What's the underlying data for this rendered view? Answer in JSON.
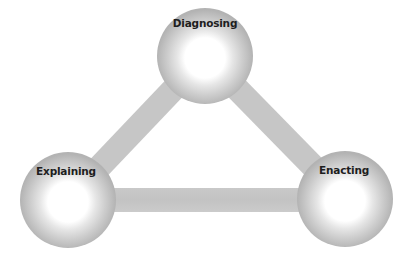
{
  "diagram": {
    "type": "cycle-triangle",
    "nodes": [
      {
        "id": "diagnosing",
        "label": "Diagnosing",
        "position": "top"
      },
      {
        "id": "explaining",
        "label": "Explaining",
        "position": "bottom-left"
      },
      {
        "id": "enacting",
        "label": "Enacting",
        "position": "bottom-right"
      }
    ],
    "edges": [
      {
        "from": "diagnosing",
        "to": "explaining"
      },
      {
        "from": "diagnosing",
        "to": "enacting"
      },
      {
        "from": "explaining",
        "to": "enacting"
      }
    ],
    "colors": {
      "connector": "#c6c6c6",
      "node_rim": "#b5b5b5",
      "node_mid": "#d6d6d6",
      "node_center": "#ffffff",
      "label": "#1e1e1e",
      "background": "#ffffff"
    }
  }
}
